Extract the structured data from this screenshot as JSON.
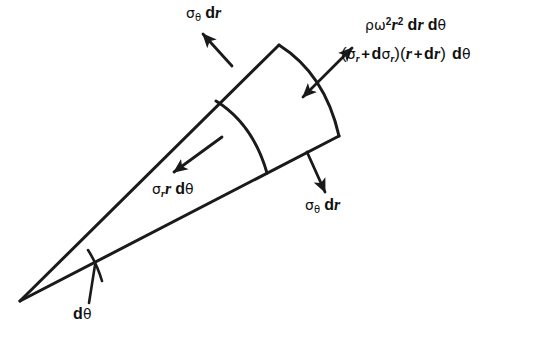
{
  "figure": {
    "background_color": "#ffffff",
    "line_color": "#1a1a1a",
    "text_color": "#111111"
  },
  "labels": {
    "sigma_theta_dr_top": {
      "text": "σθ dr",
      "symbol": "σ",
      "subscript": "θ",
      "operator": "dr"
    },
    "body_force": {
      "text": "ρω²r² dr dθ",
      "rho": "ρ",
      "omega": "ω",
      "omega_exp": "2",
      "r": "r",
      "r_exp": "2",
      "dr": "dr",
      "dtheta": "dθ"
    },
    "radial_outer": {
      "text": "(σr + dσr)(r + dr) dθ",
      "sigma": "σ",
      "sub_r": "r",
      "plus": "+",
      "d": "d",
      "r": "r",
      "dr": "dr",
      "dtheta": "dθ"
    },
    "radial_inner": {
      "text": "σr r dθ",
      "sigma": "σ",
      "sub_r": "r",
      "r": "r",
      "dtheta": "dθ"
    },
    "sigma_theta_dr_bottom": {
      "text": "σθ dr",
      "symbol": "σ",
      "subscript": "θ",
      "operator": "dr"
    },
    "dtheta_angle": {
      "text": "dθ",
      "d": "d",
      "theta": "θ"
    }
  },
  "geometry": {
    "apex": {
      "x": 20,
      "y": 301
    },
    "upper_edge_end": {
      "x": 279,
      "y": 45
    },
    "lower_edge_end": {
      "x": 339,
      "y": 136
    },
    "inner_arc_start": {
      "x": 216,
      "y": 101
    },
    "inner_arc_end": {
      "x": 267,
      "y": 173
    },
    "wedge_angle_deg": 16
  }
}
